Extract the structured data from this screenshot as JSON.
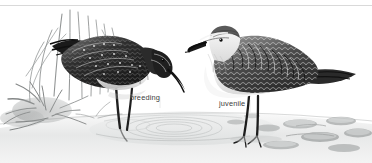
{
  "plate": {
    "title": "Shorebird identification plate",
    "width": 372,
    "height": 163,
    "medium": "grayscale watercolour / pencil illustration",
    "background_color": "#ffffff",
    "rule_color": "#d9d9d9"
  },
  "labels": {
    "breeding": "breeding",
    "juvenile": "juvenile",
    "text_color": "#3b3b3b"
  },
  "birds": [
    {
      "id": "breeding-adult",
      "label": "breeding",
      "position": "left",
      "pose": "head lowered, probing in shallow water",
      "plumage_tone": "#2a2a2a",
      "belly_tone": "#e6e6e6",
      "bill": "long, slightly decurved, dark",
      "legs": "dark, standing in water with ripples"
    },
    {
      "id": "juvenile",
      "label": "juvenile",
      "position": "right",
      "pose": "upright, alert, facing left",
      "plumage_tone": "#4a4a4a",
      "belly_tone": "#f2f2f2",
      "bill": "long, slightly decurved, dark",
      "legs": "dark, standing on wet mud"
    }
  ],
  "scenery": {
    "vegetation": "sedge and grass tufts behind the breeding bird, lower left",
    "water": "shallow pool with concentric ripples, centre-left",
    "mudflat": "pale wet mud with scattered pebbles, lower right",
    "tones": {
      "water": "#e9eaea",
      "mud": "#e2e3e3",
      "pebble": "#b9bcbc",
      "vegetation": "#8d9090"
    }
  }
}
